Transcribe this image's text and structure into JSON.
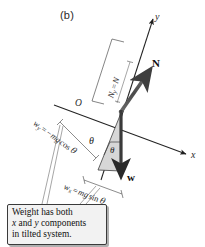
{
  "figure": {
    "panel_label": "(b)",
    "axes": {
      "y_label": "y",
      "x_label": "x",
      "origin_label": "O"
    },
    "vectors": [
      {
        "name": "normal-force",
        "label": "N",
        "style": "bold"
      },
      {
        "name": "weight",
        "label": "w",
        "style": "bold"
      }
    ],
    "angles": {
      "incline_angle": "θ",
      "interior_angle": "θ"
    },
    "components": {
      "normal_y": {
        "symbol": "N",
        "subscript": "y",
        "equals": "=",
        "expression": "N",
        "full": "N_y = N"
      },
      "weight_y": {
        "symbol": "w",
        "subscript": "y",
        "equals": "=",
        "expression": "−mg cos θ",
        "sign": "−",
        "magnitude": "mg",
        "trig": "cos",
        "angle": "θ",
        "full": "w_y = −mg cos θ"
      },
      "weight_x": {
        "symbol": "w",
        "subscript": "x",
        "equals": "=",
        "expression": "mg sin θ",
        "magnitude": "mg",
        "trig": "sin",
        "angle": "θ",
        "full": "w_x = mg sin θ"
      }
    },
    "callout": {
      "line1": "Weight has both",
      "line2_part1": "x",
      "line2_part2": " and ",
      "line2_part3": "y",
      "line2_part4": " components",
      "line3": "in tilted system."
    },
    "colors": {
      "ink": "#1a1a1a",
      "vector_fill": "#4d4d4d",
      "triangle_fill": "#d9d9d9",
      "callout_bg": "#f2f2f2",
      "callout_border": "#3a3a3a",
      "paper": "#ffffff"
    }
  }
}
